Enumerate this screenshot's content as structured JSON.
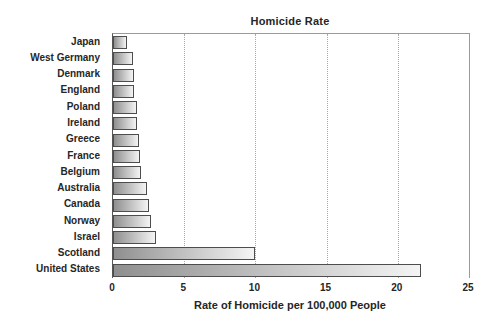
{
  "chart_data": {
    "type": "bar",
    "orientation": "horizontal",
    "title": "Homicide Rate",
    "xlabel": "Rate of Homicide per 100,000 People",
    "categories": [
      "Japan",
      "West Germany",
      "Denmark",
      "England",
      "Poland",
      "Ireland",
      "Greece",
      "France",
      "Belgium",
      "Australia",
      "Canada",
      "Norway",
      "Israel",
      "Scotland",
      "United States"
    ],
    "values": [
      1.0,
      1.4,
      1.5,
      1.5,
      1.7,
      1.7,
      1.8,
      1.9,
      2.0,
      2.4,
      2.5,
      2.7,
      3.0,
      10.0,
      21.6
    ],
    "xlim": [
      0,
      25
    ],
    "xticks": [
      0,
      5,
      10,
      15,
      20,
      25
    ],
    "grid": "vertical-dotted",
    "legend": "none"
  },
  "colors": {
    "background": "#ffffff",
    "bar_gradient_start": "#8f8f8f",
    "bar_gradient_end": "#f4f4f4",
    "bar_border": "#4d4d4d",
    "gridline": "#a8a8a8",
    "frame": "#9a9a9a",
    "axis_line": "#555555",
    "text": "#262626"
  }
}
